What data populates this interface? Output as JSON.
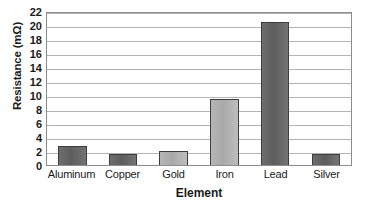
{
  "chart_data": {
    "type": "bar",
    "title": "",
    "subtitle": "",
    "xlabel": "Element",
    "ylabel": "Resistance (mΩ)",
    "categories": [
      "Aluminum",
      "Copper",
      "Gold",
      "Iron",
      "Lead",
      "Silver"
    ],
    "values": [
      2.7,
      1.6,
      2.0,
      9.4,
      20.5,
      1.6
    ],
    "series": [
      {
        "name": "Resistance",
        "values": [
          2.7,
          1.6,
          2.0,
          9.4,
          20.5,
          1.6
        ]
      }
    ],
    "ylim": [
      0,
      22
    ],
    "ytick_step": 2,
    "yticks": [
      0,
      2,
      4,
      6,
      8,
      10,
      12,
      14,
      16,
      18,
      20,
      22
    ],
    "ytick_labels": [
      "0",
      "2",
      "4",
      "6",
      "8",
      "10",
      "12",
      "14",
      "16",
      "18",
      "20",
      "22"
    ],
    "xlim_categories": 6,
    "grid": true,
    "grid_axis": "y",
    "legend": false,
    "legend_position": "none",
    "annotations": [],
    "bar_shades": [
      "dark",
      "dark",
      "light",
      "light",
      "dark",
      "dark"
    ],
    "colors": {
      "bar_dark": "#5d5d5d",
      "bar_light": "#a9a9a9",
      "bar_border": "#3d3d3d",
      "gridline": "#b4b4b4",
      "axis_border": "#8c8c8c",
      "text": "#1a1a1a",
      "background": "#ffffff"
    }
  }
}
